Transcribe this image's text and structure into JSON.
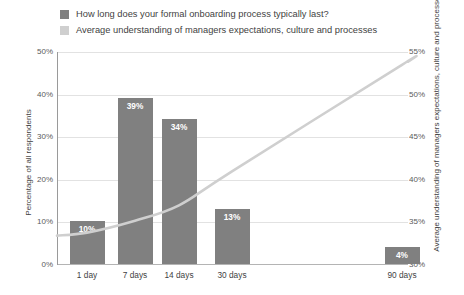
{
  "legend": {
    "items": [
      {
        "label": "How long does your formal onboarding process typically last?",
        "color": "#808080",
        "icon": "legend-swatch-bars"
      },
      {
        "label": "Average understanding of managers expectations, culture and processes",
        "color": "#cfcfcf",
        "icon": "legend-swatch-line"
      }
    ]
  },
  "axes": {
    "left_title": "Percentage of all respondents",
    "right_title": "Average understanding of managers expectations, culture and processes",
    "left_ticks": [
      "0%",
      "10%",
      "20%",
      "30%",
      "40%",
      "50%"
    ],
    "right_ticks": [
      "30%",
      "35%",
      "40%",
      "45%",
      "50%",
      "55%"
    ]
  },
  "chart_data": {
    "type": "bar",
    "title": "",
    "subtitle": "",
    "xlabel": "",
    "ylabel": "Percentage of all respondents",
    "y2label": "Average understanding of managers expectations, culture and processes",
    "categories": [
      "1 day",
      "7 days",
      "14 days",
      "30 days",
      "90 days"
    ],
    "x_positions_days": [
      1,
      7,
      14,
      30,
      90
    ],
    "ylim": [
      0,
      50
    ],
    "y2lim": [
      30,
      55
    ],
    "grid": true,
    "legend_position": "top-left",
    "series": [
      {
        "name": "How long does your formal onboarding process typically last?",
        "type": "bar",
        "axis": "left",
        "color": "#808080",
        "values": [
          10,
          39,
          34,
          13,
          4
        ],
        "labels": [
          "10%",
          "39%",
          "34%",
          "13%",
          "4%"
        ]
      },
      {
        "name": "Average understanding of managers expectations, culture and processes",
        "type": "line",
        "axis": "right",
        "color": "#cfcfcf",
        "x": [
          1,
          7,
          14,
          30,
          90
        ],
        "values": [
          33.8,
          35.2,
          37.0,
          41.0,
          53.5
        ]
      }
    ]
  }
}
